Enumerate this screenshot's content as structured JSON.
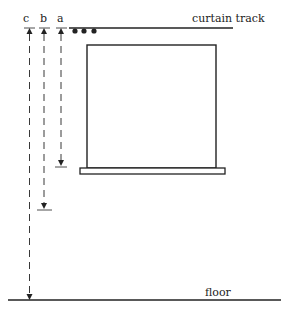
{
  "diagram": {
    "labels": {
      "curtain_track": "curtain track",
      "floor": "floor",
      "a": "a",
      "b": "b",
      "c": "c"
    },
    "measurements": [
      {
        "id": "a",
        "description": "track to sill"
      },
      {
        "id": "b",
        "description": "track to below sill"
      },
      {
        "id": "c",
        "description": "track to floor"
      }
    ],
    "colors": {
      "line": "#222222",
      "background": "#ffffff"
    }
  }
}
